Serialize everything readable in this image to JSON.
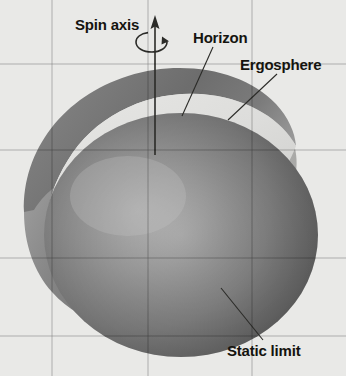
{
  "figure": {
    "background_color": "#e9e9e7",
    "width": 346,
    "height": 376
  },
  "labels": {
    "spin_axis": "Spin axis",
    "horizon": "Horizon",
    "ergosphere": "Ergosphere",
    "static_limit": "Static limit"
  },
  "icons": {
    "spin_axis_arrow": "up-arrow-icon",
    "rotation_curve": "rotation-arrow-icon",
    "leader_horizon": "leader-line-icon",
    "leader_ergosphere": "leader-line-icon",
    "leader_static_limit": "leader-line-icon"
  },
  "colors": {
    "background": "#e9e9e7",
    "text": "#15140f",
    "leader_line": "#2b2b28",
    "sphere_dark": "#4a4a4a",
    "sphere_mid": "#939393",
    "sphere_light": "#b9b9b9",
    "shell_outer_dark": "#6f6f6f",
    "shell_outer_mid": "#8e8e8e",
    "shell_inner_light": "#dcdcdc",
    "shell_highlight": "#e4e4e2"
  },
  "geometry": {
    "ergosphere_shape": "oblate-spheroid-cutaway",
    "horizon_shape": "sphere",
    "static_limit_shape": "outer-sphere-surface",
    "spin_axis_orientation": "vertical"
  }
}
